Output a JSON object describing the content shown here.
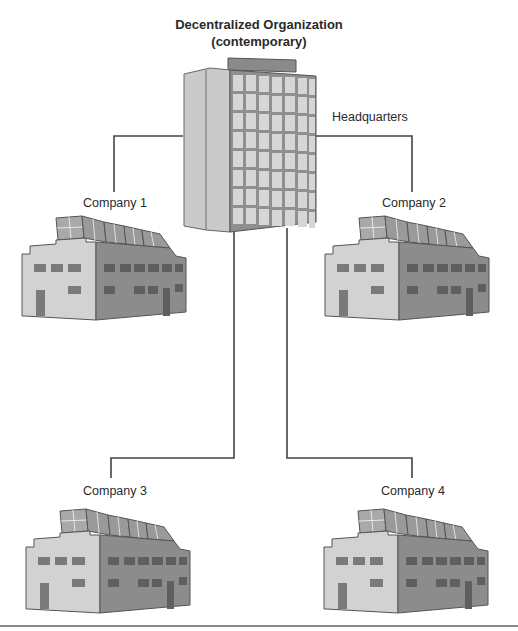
{
  "title": {
    "line1": "Decentralized Organization",
    "line2": "(contemporary)"
  },
  "headquarters": {
    "label": "Headquarters",
    "icon": "office-tower-icon"
  },
  "companies": [
    {
      "label": "Company 1",
      "icon": "factory-icon"
    },
    {
      "label": "Company 2",
      "icon": "factory-icon"
    },
    {
      "label": "Company 3",
      "icon": "factory-icon"
    },
    {
      "label": "Company 4",
      "icon": "factory-icon"
    }
  ],
  "colors": {
    "line": "#444444",
    "tower_side": "#c9c9c9",
    "tower_front": "#8e8e8e",
    "window": "#d6d6d6",
    "factory_light": "#d2d2d2",
    "factory_dark": "#8c8c8c",
    "factory_window": "#6f6f6f"
  }
}
